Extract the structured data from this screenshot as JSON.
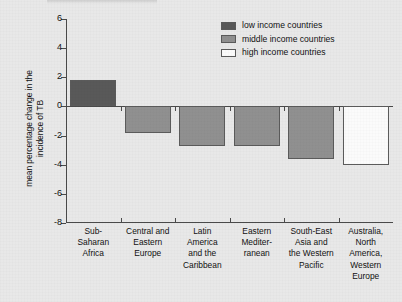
{
  "chart_data": {
    "type": "bar",
    "title": "",
    "xlabel": "",
    "ylabel": "mean percentage change in the incidence of TB",
    "ylabel_lines": [
      "mean percentage change in the",
      "incidence of TB"
    ],
    "ylim": [
      -8,
      6
    ],
    "yticks": [
      6,
      4,
      2,
      0,
      -2,
      -4,
      -6,
      -8
    ],
    "ytick_labels": [
      "6",
      "4",
      "2",
      "0",
      "-2",
      "-4",
      "-6",
      "-8"
    ],
    "grid": false,
    "legend_position": "top-right",
    "categories": [
      "Sub-Saharan Africa",
      "Central and Eastern Europe",
      "Latin America and the Caribbean",
      "Eastern Mediterranean",
      "South-East Asia and the Western Pacific",
      "Australia, North America, Western Europe"
    ],
    "category_label_lines": [
      [
        "Sub-",
        "Saharan",
        "Africa"
      ],
      [
        "Central and",
        "Eastern",
        "Europe"
      ],
      [
        "Latin",
        "America",
        "and the",
        "Caribbean"
      ],
      [
        "Eastern",
        "Mediter-",
        "ranean"
      ],
      [
        "South-East",
        "Asia and",
        "the Western",
        "Pacific"
      ],
      [
        "Australia,",
        "North",
        "America,",
        "Western",
        "Europe"
      ]
    ],
    "values": [
      1.8,
      -1.8,
      -2.7,
      -2.7,
      -3.6,
      -4.0
    ],
    "bar_groups": [
      "low",
      "middle",
      "middle",
      "middle",
      "middle",
      "high"
    ],
    "series": [
      {
        "name": "mean percentage change in the incidence of TB",
        "values": [
          1.8,
          -1.8,
          -2.7,
          -2.7,
          -3.6,
          -4.0
        ]
      }
    ],
    "legend": [
      {
        "key": "low",
        "label": "low income countries",
        "color": "#595959"
      },
      {
        "key": "middle",
        "label": "middle income countries",
        "color": "#909090"
      },
      {
        "key": "high",
        "label": "high income countries",
        "color": "#fbfbfb"
      }
    ]
  }
}
